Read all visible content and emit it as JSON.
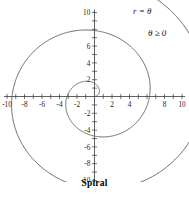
{
  "figure": {
    "caption": "Spiral",
    "annotations": [
      {
        "name": "equation",
        "text": "r = θ",
        "x": 133,
        "y": 14
      },
      {
        "name": "domain-constraint",
        "text": "θ ≥ 0",
        "x": 148,
        "y": 36
      }
    ]
  },
  "chart_data": {
    "type": "line",
    "title": "Spiral",
    "equation": "r = θ",
    "domain_constraint": "θ ≥ 0",
    "coordinate_system": "polar-on-cartesian-axes",
    "xlabel": "",
    "ylabel": "",
    "xlim": [
      -10,
      10
    ],
    "ylim": [
      -10,
      10
    ],
    "grid": false,
    "legend": "none",
    "tick_step": 1,
    "label_step": 2,
    "x_tick_labels": [
      "-10",
      "-8",
      "-6",
      "-4",
      "-2",
      "2",
      "4",
      "8",
      "10"
    ],
    "x_tick_values": [
      -10,
      -8,
      -6,
      -4,
      -2,
      2,
      4,
      8,
      10
    ],
    "x_hidden_labels": [
      6
    ],
    "y_tick_labels": [
      "10",
      "6",
      "4",
      "2",
      "-2",
      "-4",
      "-6",
      "-8",
      "-10"
    ],
    "y_tick_values": [
      10,
      6,
      4,
      2,
      -2,
      -4,
      -6,
      -8,
      -10
    ],
    "y_hidden_labels": [
      8
    ],
    "theta_range": [
      0,
      13.6
    ],
    "series": [
      {
        "name": "r = θ",
        "color": "#5a5a5a",
        "points_polar": [
          {
            "theta": 0.0,
            "r": 0.0
          },
          {
            "theta": 0.5,
            "r": 0.5
          },
          {
            "theta": 1.0,
            "r": 1.0
          },
          {
            "theta": 1.5,
            "r": 1.5
          },
          {
            "theta": 2.0,
            "r": 2.0
          },
          {
            "theta": 2.5,
            "r": 2.5
          },
          {
            "theta": 3.0,
            "r": 3.0
          },
          {
            "theta": 3.5,
            "r": 3.5
          },
          {
            "theta": 4.0,
            "r": 4.0
          },
          {
            "theta": 4.5,
            "r": 4.5
          },
          {
            "theta": 5.0,
            "r": 5.0
          },
          {
            "theta": 5.5,
            "r": 5.5
          },
          {
            "theta": 6.0,
            "r": 6.0
          },
          {
            "theta": 6.5,
            "r": 6.5
          },
          {
            "theta": 7.0,
            "r": 7.0
          },
          {
            "theta": 7.5,
            "r": 7.5
          },
          {
            "theta": 8.0,
            "r": 8.0
          },
          {
            "theta": 8.5,
            "r": 8.5
          },
          {
            "theta": 9.0,
            "r": 9.0
          },
          {
            "theta": 9.5,
            "r": 9.5
          },
          {
            "theta": 10.0,
            "r": 10.0
          },
          {
            "theta": 10.5,
            "r": 10.5
          },
          {
            "theta": 11.0,
            "r": 11.0
          },
          {
            "theta": 11.5,
            "r": 11.5
          },
          {
            "theta": 12.0,
            "r": 12.0
          },
          {
            "theta": 12.5,
            "r": 12.5
          },
          {
            "theta": 13.0,
            "r": 13.0
          },
          {
            "theta": 13.6,
            "r": 13.6
          }
        ]
      }
    ]
  }
}
